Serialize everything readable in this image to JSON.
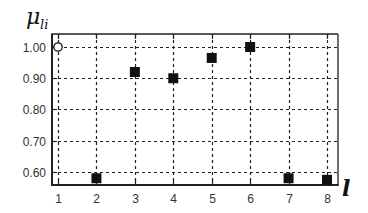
{
  "chart_data": {
    "type": "scatter",
    "title": "",
    "xlabel": "l",
    "ylabel": "μ_li",
    "ylabel_main": "μ",
    "ylabel_sub": "li",
    "x": [
      1,
      2,
      3,
      4,
      5,
      6,
      7,
      8
    ],
    "series": [
      {
        "name": "hollow",
        "marker": "circle-open",
        "points": [
          {
            "x": 1,
            "y": 1.0
          }
        ]
      },
      {
        "name": "filled",
        "marker": "square-filled",
        "points": [
          {
            "x": 2,
            "y": 0.58
          },
          {
            "x": 3,
            "y": 0.92
          },
          {
            "x": 4,
            "y": 0.9
          },
          {
            "x": 5,
            "y": 0.965
          },
          {
            "x": 6,
            "y": 1.0
          },
          {
            "x": 7,
            "y": 0.58
          },
          {
            "x": 8,
            "y": 0.575
          }
        ]
      }
    ],
    "xticks": [
      "1",
      "2",
      "3",
      "4",
      "5",
      "6",
      "7",
      "8"
    ],
    "yticks": [
      "1.00",
      "0.90",
      "0.80",
      "0.70",
      "0.60"
    ],
    "ytick_values": [
      1.0,
      0.9,
      0.8,
      0.7,
      0.6
    ],
    "xlim": [
      0.85,
      8.25
    ],
    "ylim": [
      0.56,
      1.04
    ],
    "grid": true,
    "grid_style": "dotted",
    "legend": null
  },
  "colors": {
    "frame": "#222222",
    "grid": "#222222",
    "marker": "#111111",
    "text": "#333333"
  }
}
